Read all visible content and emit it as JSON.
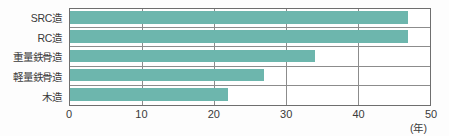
{
  "chart_data": {
    "type": "bar",
    "orientation": "horizontal",
    "title": "",
    "subtitle": "",
    "xlabel": "(年)",
    "ylabel": "",
    "categories": [
      "SRC造",
      "RC造",
      "重量鉄骨造",
      "軽量鉄骨造",
      "木造"
    ],
    "values": [
      47,
      47,
      34,
      27,
      22
    ],
    "xlim": [
      0,
      50
    ],
    "xticks": [
      0,
      10,
      20,
      30,
      40,
      50
    ],
    "xtick_labels": [
      "0",
      "10",
      "20",
      "30",
      "40",
      "50"
    ],
    "unit_label": "(年)",
    "grid": true,
    "grid_axis": "x",
    "legend": false,
    "legend_position": "none",
    "bar_color": "#6db6ad",
    "frame_color": "#6e6e6e",
    "grid_color": "#8c8c8c",
    "background_color": "#ffffff",
    "series": [
      {
        "name": "法定耐用年数",
        "values": [
          47,
          47,
          34,
          27,
          22
        ]
      }
    ],
    "points": [
      {
        "category": "SRC造",
        "value": 47
      },
      {
        "category": "RC造",
        "value": 47
      },
      {
        "category": "重量鉄骨造",
        "value": 34
      },
      {
        "category": "軽量鉄骨造",
        "value": 27
      },
      {
        "category": "木造",
        "value": 22
      }
    ]
  }
}
